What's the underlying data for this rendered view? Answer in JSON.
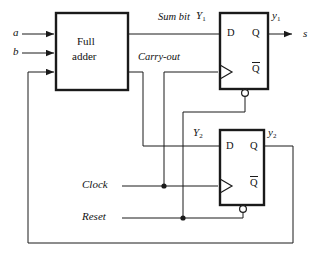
{
  "diagram": {
    "type": "digital-logic-block-diagram",
    "stroke_color": "#1a1a1a",
    "background": "#ffffff"
  },
  "blocks": [
    {
      "name": "full-adder",
      "label_line1": "Full",
      "label_line2": "adder",
      "x": 56,
      "y": 13,
      "w": 72,
      "h": 77
    },
    {
      "name": "flip-flop-1",
      "x": 220,
      "y": 13,
      "w": 48,
      "h": 76,
      "pin_d": "D",
      "pin_q": "Q",
      "pin_qbar": "Q",
      "pin_qbar_overbar": true
    },
    {
      "name": "flip-flop-2",
      "x": 220,
      "y": 130,
      "w": 44,
      "h": 75,
      "pin_d": "D",
      "pin_q": "Q",
      "pin_qbar": "Q",
      "pin_qbar_overbar": true
    }
  ],
  "inputs": [
    {
      "name": "input-a",
      "label": "a",
      "y": 34
    },
    {
      "name": "input-b",
      "label": "b",
      "y": 53
    },
    {
      "name": "input-carry-feedback",
      "label": "",
      "y": 72
    },
    {
      "name": "input-clock",
      "label": "Clock",
      "y": 186
    },
    {
      "name": "input-reset",
      "label": "Reset",
      "y": 218
    }
  ],
  "outputs": [
    {
      "name": "output-s",
      "label": "s",
      "y": 34
    }
  ],
  "signals": [
    {
      "name": "sum-bit",
      "label": "Sum bit",
      "x": 158,
      "y": 17
    },
    {
      "name": "carry-out",
      "label": "Carry-out",
      "x": 138,
      "y": 56
    },
    {
      "name": "next-state-y1",
      "label": "Y",
      "subscript": "1",
      "x": 196,
      "y": 14
    },
    {
      "name": "next-state-y2",
      "label": "Y",
      "subscript": "2",
      "x": 193,
      "y": 131
    },
    {
      "name": "state-y1",
      "label": "y",
      "subscript": "1",
      "x": 274,
      "y": 14
    },
    {
      "name": "state-y2",
      "label": "y",
      "subscript": "2",
      "x": 270,
      "y": 131
    }
  ],
  "labels": {
    "a": "a",
    "b": "b",
    "s": "s",
    "clock": "Clock",
    "reset": "Reset",
    "sum_bit": "Sum bit",
    "carry_out": "Carry-out",
    "full": "Full",
    "adder": "adder",
    "D": "D",
    "Q": "Q",
    "Qbar": "Q",
    "Y1_base": "Y",
    "Y1_sub": "1",
    "Y2_base": "Y",
    "Y2_sub": "2",
    "y1_base": "y",
    "y1_sub": "1",
    "y2_base": "y",
    "y2_sub": "2"
  }
}
